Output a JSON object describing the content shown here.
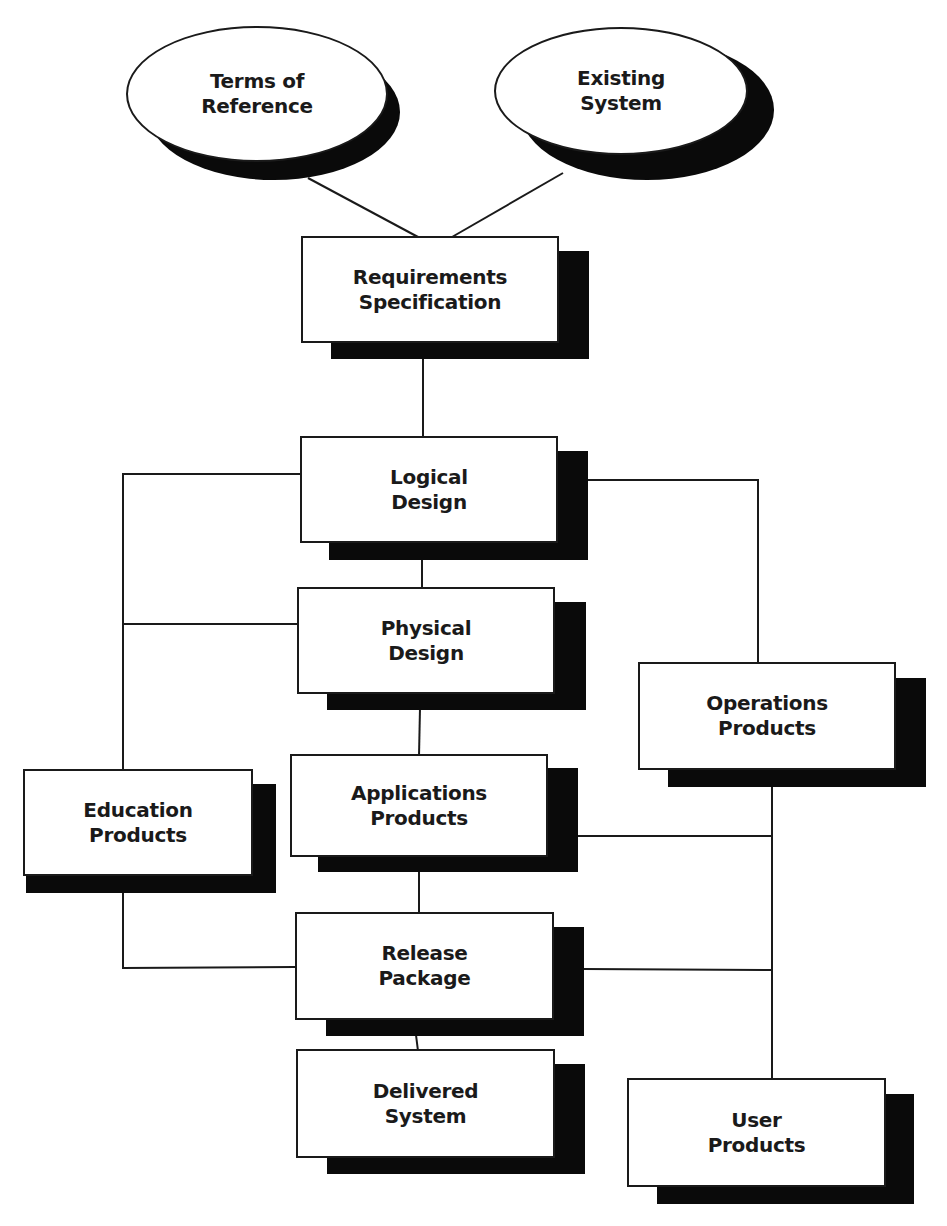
{
  "diagram": {
    "type": "flowchart",
    "colors": {
      "line": "#1a1a1a",
      "shadow": "#0a0a0a",
      "fill": "#ffffff"
    },
    "nodes": {
      "terms_of_reference": {
        "label": "Terms of\nReference",
        "shape": "ellipse"
      },
      "existing_system": {
        "label": "Existing\nSystem",
        "shape": "ellipse"
      },
      "requirements_specification": {
        "label": "Requirements\nSpecification",
        "shape": "box"
      },
      "logical_design": {
        "label": "Logical\nDesign",
        "shape": "box"
      },
      "physical_design": {
        "label": "Physical\nDesign",
        "shape": "box"
      },
      "operations_products": {
        "label": "Operations\nProducts",
        "shape": "box"
      },
      "education_products": {
        "label": "Education\nProducts",
        "shape": "box"
      },
      "applications_products": {
        "label": "Applications\nProducts",
        "shape": "box"
      },
      "release_package": {
        "label": "Release\nPackage",
        "shape": "box"
      },
      "delivered_system": {
        "label": "Delivered\nSystem",
        "shape": "box"
      },
      "user_products": {
        "label": "User\nProducts",
        "shape": "box"
      }
    },
    "edges": [
      [
        "Terms of Reference",
        "Requirements Specification"
      ],
      [
        "Existing System",
        "Requirements Specification"
      ],
      [
        "Requirements Specification",
        "Logical Design"
      ],
      [
        "Logical Design",
        "Physical Design"
      ],
      [
        "Logical Design",
        "Education Products"
      ],
      [
        "Physical Design",
        "Education Products"
      ],
      [
        "Logical Design",
        "Operations Products"
      ],
      [
        "Physical Design",
        "Applications Products"
      ],
      [
        "Applications Products",
        "Release Package"
      ],
      [
        "Education Products",
        "Release Package"
      ],
      [
        "Operations Products",
        "User Products"
      ],
      [
        "Applications Products",
        "User Products"
      ],
      [
        "Release Package",
        "User Products"
      ],
      [
        "Release Package",
        "Delivered System"
      ]
    ]
  }
}
